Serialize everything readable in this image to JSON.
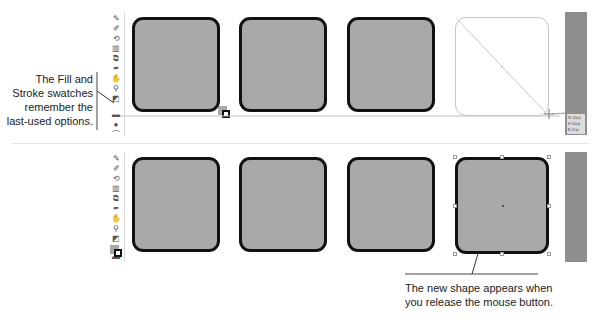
{
  "callouts": {
    "left": {
      "lines": [
        "The Fill and",
        "Stroke swatches",
        "remember the",
        "last-used options."
      ]
    },
    "bottom": {
      "lines": [
        "The new shape appears when",
        "you release the mouse button."
      ]
    }
  },
  "toolbar": {
    "tools": [
      {
        "name": "pen-icon",
        "glyph": "✎"
      },
      {
        "name": "brush-icon",
        "glyph": "✐"
      },
      {
        "name": "rotate-icon",
        "glyph": "⟲"
      },
      {
        "name": "chart-icon",
        "glyph": "▥"
      },
      {
        "name": "artboard-icon",
        "glyph": "⧉"
      },
      {
        "name": "eyedropper-icon",
        "glyph": "✒"
      },
      {
        "name": "hand-icon",
        "glyph": "✋"
      },
      {
        "name": "zoom-icon",
        "glyph": "⚲"
      },
      {
        "name": "default-colors-icon",
        "glyph": "◩"
      },
      {
        "name": "fill-stroke-swatches",
        "glyph": ""
      },
      {
        "name": "color-mode-icon",
        "glyph": "▬"
      },
      {
        "name": "screen-mode-icon",
        "glyph": "●"
      },
      {
        "name": "draw-mode-icon",
        "glyph": "⌒"
      }
    ]
  },
  "top_row": {
    "shapes": [
      {
        "state": "filled"
      },
      {
        "state": "filled"
      },
      {
        "state": "filled"
      },
      {
        "state": "drawing-preview"
      }
    ],
    "tooltip": {
      "lines": [
        "W: 124 pt",
        "H: 124 pt",
        "R: 12 pt"
      ]
    }
  },
  "bottom_row": {
    "shapes": [
      {
        "state": "filled"
      },
      {
        "state": "filled"
      },
      {
        "state": "filled"
      },
      {
        "state": "selected"
      }
    ]
  },
  "colors": {
    "shape_fill": "#a9a9a9",
    "shape_stroke": "#111111",
    "panel": "#8e8e8e"
  }
}
